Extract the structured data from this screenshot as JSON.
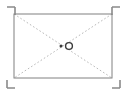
{
  "canvas": {
    "width": 128,
    "height": 96,
    "background_color": "#ffffff",
    "title": "Registration frame with diagonal guides and center marks"
  },
  "frame": {
    "name": "bounding-rectangle",
    "x": 14,
    "y": 14,
    "width": 98,
    "height": 64,
    "stroke_color": "#808080",
    "stroke_width": 1,
    "fill": "none",
    "label": "Frame"
  },
  "diagonals": {
    "name": "diagonal-guides",
    "stroke_color": "#b9b9b9",
    "stroke_width": 1,
    "dash_pattern": "1.6 2.2",
    "lines": [
      {
        "name": "diagonal-tl-br",
        "x1": 14,
        "y1": 14,
        "x2": 112,
        "y2": 78,
        "label": "Top-left to bottom-right"
      },
      {
        "name": "diagonal-tr-bl",
        "x1": 112,
        "y1": 14,
        "x2": 14,
        "y2": 78,
        "label": "Top-right to bottom-left"
      }
    ]
  },
  "center_marks": {
    "name": "center-marks",
    "stroke_color": "#4a4a4a",
    "dot": {
      "name": "center-dot",
      "cx": 61,
      "cy": 46,
      "r": 1.5,
      "fill": "#3a3a3a",
      "label": "Origin point"
    },
    "ring": {
      "name": "center-ring",
      "cx": 69,
      "cy": 46,
      "r": 3.4,
      "fill": "none",
      "stroke": "#3a3a3a",
      "stroke_width": 1.4,
      "label": "Target ring"
    }
  },
  "corner_marks": {
    "name": "corner-registration-marks",
    "stroke_color": "#8a8a8a",
    "stroke_width": 1.6,
    "arm_length": 8,
    "items": [
      {
        "name": "corner-mark-top-left",
        "position": "top-left",
        "corner_x": 7,
        "corner_y": 7,
        "orientation": "down-right",
        "label": "TL"
      },
      {
        "name": "corner-mark-top-right",
        "position": "top-right",
        "corner_x": 120,
        "corner_y": 7,
        "orientation": "down-left",
        "label": "TR"
      },
      {
        "name": "corner-mark-bottom-left",
        "position": "bottom-left",
        "corner_x": 7,
        "corner_y": 88,
        "orientation": "up-right",
        "label": "BL"
      },
      {
        "name": "corner-mark-bottom-right",
        "position": "bottom-right",
        "corner_x": 120,
        "corner_y": 88,
        "orientation": "up-left",
        "label": "BR"
      }
    ]
  }
}
